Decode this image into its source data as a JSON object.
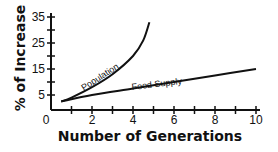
{
  "chart_data": {
    "type": "line",
    "title": "",
    "xlabel": "Number of Generations",
    "ylabel": "% of Increase",
    "xlim": [
      0,
      10
    ],
    "ylim": [
      0,
      35
    ],
    "x_ticks": [
      0,
      2,
      4,
      6,
      8,
      10
    ],
    "x_tick_labels": [
      "0",
      "2",
      "4",
      "6",
      "8",
      "10"
    ],
    "y_ticks": [
      5,
      15,
      25,
      35
    ],
    "y_tick_labels": [
      "5",
      "15",
      "25",
      "35"
    ],
    "grid": false,
    "legend": "inline labels on curves",
    "series": [
      {
        "name": "Population",
        "x": [
          0.5,
          1,
          2,
          3,
          4,
          4.5,
          4.8
        ],
        "y": [
          2.5,
          4,
          8,
          13,
          20,
          26,
          33
        ]
      },
      {
        "name": "Food Supply",
        "x": [
          0.5,
          2,
          4,
          6,
          8,
          10
        ],
        "y": [
          2.5,
          5,
          7.5,
          10,
          12.5,
          15
        ]
      }
    ]
  }
}
